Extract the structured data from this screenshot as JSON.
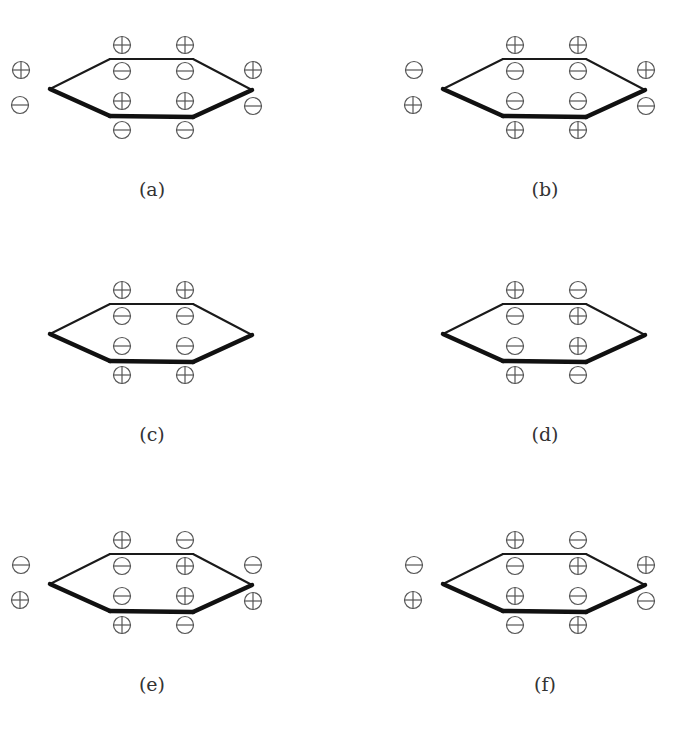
{
  "figure": {
    "colors": {
      "line": "#1a1a1a",
      "bold_line": "#111111",
      "circle": "#555555",
      "label": "#333333"
    }
  },
  "panels": [
    {
      "id": "a",
      "label": "(a)",
      "offset": [
        0,
        0
      ],
      "signs": {
        "left_upper": "+",
        "left_lower": "-",
        "c1_top": "+",
        "c1_inner": "-",
        "c2_top": "+",
        "c2_inner": "-",
        "c4_inner": "+",
        "c4_bottom": "-",
        "c5_inner": "+",
        "c5_bottom": "-",
        "right_upper": "+",
        "right_lower": "-"
      }
    },
    {
      "id": "b",
      "label": "(b)",
      "offset": [
        393,
        0
      ],
      "signs": {
        "left_upper": "-",
        "left_lower": "+",
        "c1_top": "+",
        "c1_inner": "-",
        "c2_top": "+",
        "c2_inner": "-",
        "c4_inner": "-",
        "c4_bottom": "+",
        "c5_inner": "-",
        "c5_bottom": "+",
        "right_upper": "+",
        "right_lower": "-"
      }
    },
    {
      "id": "c",
      "label": "(c)",
      "offset": [
        0,
        245
      ],
      "signs": {
        "left_upper": null,
        "left_lower": null,
        "c1_top": "+",
        "c1_inner": "-",
        "c2_top": "+",
        "c2_inner": "-",
        "c4_inner": "-",
        "c4_bottom": "+",
        "c5_inner": "-",
        "c5_bottom": "+",
        "right_upper": null,
        "right_lower": null
      }
    },
    {
      "id": "d",
      "label": "(d)",
      "offset": [
        393,
        245
      ],
      "signs": {
        "left_upper": null,
        "left_lower": null,
        "c1_top": "+",
        "c1_inner": "-",
        "c2_top": "-",
        "c2_inner": "+",
        "c4_inner": "-",
        "c4_bottom": "+",
        "c5_inner": "+",
        "c5_bottom": "-",
        "right_upper": null,
        "right_lower": null
      }
    },
    {
      "id": "e",
      "label": "(e)",
      "offset": [
        0,
        495
      ],
      "signs": {
        "left_upper": "-",
        "left_lower": "+",
        "c1_top": "+",
        "c1_inner": "-",
        "c2_top": "-",
        "c2_inner": "+",
        "c4_inner": "-",
        "c4_bottom": "+",
        "c5_inner": "+",
        "c5_bottom": "-",
        "right_upper": "-",
        "right_lower": "+"
      }
    },
    {
      "id": "f",
      "label": "(f)",
      "offset": [
        393,
        495
      ],
      "signs": {
        "left_upper": "-",
        "left_lower": "+",
        "c1_top": "+",
        "c1_inner": "-",
        "c2_top": "-",
        "c2_inner": "+",
        "c4_inner": "+",
        "c4_bottom": "-",
        "c5_inner": "-",
        "c5_bottom": "+",
        "right_upper": "+",
        "right_lower": "-"
      }
    }
  ]
}
